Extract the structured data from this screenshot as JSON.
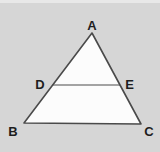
{
  "figure": {
    "colors": {
      "background": "#d6d6d6",
      "triangle_fill": "#fcfcfc",
      "line": "#4a4a4a",
      "label": "#1e1e1e"
    },
    "stroke_width_triangle": 1.6,
    "stroke_width_midsegment": 1.2,
    "vertices": [
      {
        "id": "A",
        "x": 92,
        "y": 33,
        "label": "A",
        "label_x": 92,
        "label_y": 30
      },
      {
        "id": "B",
        "x": 24,
        "y": 123,
        "label": "B",
        "label_x": 13,
        "label_y": 136
      },
      {
        "id": "C",
        "x": 141,
        "y": 124,
        "label": "C",
        "label_x": 149,
        "label_y": 136
      }
    ],
    "midsegment": {
      "from": {
        "id": "D",
        "x": 52.5,
        "y": 85,
        "label": "D",
        "label_x": 40,
        "label_y": 89
      },
      "to": {
        "id": "E",
        "x": 120,
        "y": 85,
        "label": "E",
        "label_x": 129.5,
        "label_y": 89
      }
    }
  }
}
